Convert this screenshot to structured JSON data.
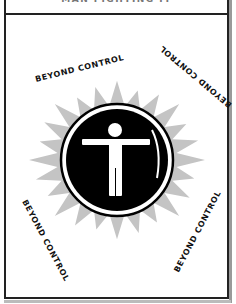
{
  "title": "MAN FIGHTING IT",
  "labels": {
    "top_left": "BEYOND CONTROL",
    "top_right": "BEYOND CONTROL",
    "bottom_left": "BEYOND CONTROL",
    "bottom_right": "BEYOND CONTROL"
  },
  "emblem": {
    "icon": "person-arms-outstretched-icon",
    "sun_color": "#c4c4c4",
    "disc_color": "#000000",
    "figure_color": "#ffffff"
  }
}
